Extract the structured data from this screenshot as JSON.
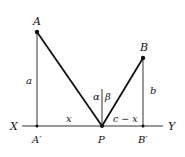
{
  "diagram": {
    "points": {
      "A": {
        "label": "A",
        "x": 37,
        "y": 32
      },
      "A_prime": {
        "label": "A′",
        "x": 37,
        "y": 126
      },
      "P": {
        "label": "P",
        "x": 102,
        "y": 126
      },
      "B": {
        "label": "B",
        "x": 143,
        "y": 58
      },
      "B_prime": {
        "label": "B′",
        "x": 143,
        "y": 126
      }
    },
    "axis": {
      "left_label": "X",
      "right_label": "Y"
    },
    "segment_labels": {
      "a": "a",
      "b": "b",
      "x": "x",
      "c_minus_x": "c − x"
    },
    "angle_labels": {
      "alpha": "α",
      "beta": "β"
    },
    "colors": {
      "line": "#111111",
      "thin_line": "#333333"
    }
  }
}
